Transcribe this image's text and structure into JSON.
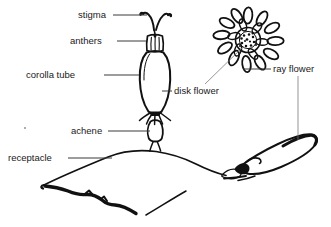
{
  "figure": {
    "background_color": "#ffffff",
    "ink_color": "#111111",
    "label_color": "#1a1a1a",
    "leader_color": "#3a3a3a"
  },
  "labels": {
    "stigma": "stigma",
    "anthers": "anthers",
    "corolla_tube": "corolla tube",
    "disk_flower": "disk flower",
    "ray_flower": "ray flower",
    "achene": "achene",
    "receptacle": "receptacle"
  },
  "parts": [
    {
      "id": "stigma",
      "label": "stigma",
      "label_x": 78,
      "label_y": 18,
      "side": "left"
    },
    {
      "id": "anthers",
      "label": "anthers",
      "label_x": 70,
      "label_y": 44,
      "side": "left"
    },
    {
      "id": "corolla-tube",
      "label": "corolla tube",
      "label_x": 26,
      "label_y": 78,
      "side": "left"
    },
    {
      "id": "disk-flower",
      "label": "disk flower",
      "label_x": 174,
      "label_y": 94,
      "side": "right"
    },
    {
      "id": "ray-flower",
      "label": "ray flower",
      "label_x": 273,
      "label_y": 72,
      "side": "right"
    },
    {
      "id": "achene",
      "label": "achene",
      "label_x": 71,
      "label_y": 134,
      "side": "left"
    },
    {
      "id": "receptacle",
      "label": "receptacle",
      "label_x": 8,
      "label_y": 161,
      "side": "left"
    }
  ]
}
